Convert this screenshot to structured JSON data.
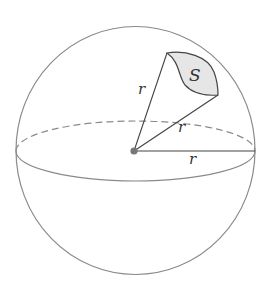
{
  "diagram": {
    "type": "sphere-solid-angle",
    "labels": {
      "region": "S",
      "radius_upper": "r",
      "radius_middle": "r",
      "radius_horizontal": "r"
    },
    "colors": {
      "stroke": "#8a8a8a",
      "dark_stroke": "#444444",
      "region_fill": "#e6e6e6",
      "center_dot": "#777777",
      "text": "#333333"
    }
  }
}
